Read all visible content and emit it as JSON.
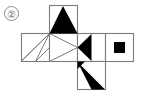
{
  "figure": {
    "item_number": "②",
    "kind": "cube-net-diagram",
    "colors": {
      "ink": "#000000",
      "outline": "#7d7d7d",
      "background": "#ffffff",
      "label": "#6e6e6e"
    },
    "geometry": {
      "cell_size": 28,
      "grid_left": 21,
      "grid_top": 5,
      "columns_x": [
        21,
        49,
        77,
        105,
        133
      ],
      "rows_y": [
        5,
        33,
        61,
        89
      ]
    },
    "cells": [
      {
        "id": "top-face",
        "position": "row1-col2",
        "x": 49,
        "y": 5,
        "contents": "filled-triangle-apex-top"
      },
      {
        "id": "left-face",
        "position": "row2-col1",
        "x": 21,
        "y": 33,
        "contents": "diagonal-line-tl-br"
      },
      {
        "id": "front-face",
        "position": "row2-col2",
        "x": 49,
        "y": 33,
        "contents": "outline-triangle-pointing-right"
      },
      {
        "id": "right-face",
        "position": "row2-col3",
        "x": 77,
        "y": 33,
        "contents": "filled-triangle-pointing-left"
      },
      {
        "id": "back-face",
        "position": "row2-col4",
        "x": 105,
        "y": 33,
        "contents": "small-filled-square"
      },
      {
        "id": "bottom-face",
        "position": "row3-col2",
        "x": 77,
        "y": 61,
        "contents": "filled-triangle-pointing-down-right"
      }
    ]
  }
}
